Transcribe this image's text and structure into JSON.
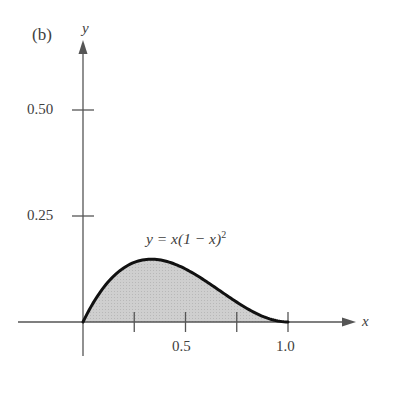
{
  "panel_label": "(b)",
  "chart_data": {
    "type": "area",
    "title": "",
    "function": "y = x(1 - x)^2",
    "equation_label": {
      "lhs": "y = x",
      "rest": "(1 − x)",
      "exponent": "2"
    },
    "xlabel": "x",
    "ylabel": "y",
    "x_ticks": [
      0.25,
      0.5,
      0.75,
      1.0
    ],
    "x_tick_labels": [
      "",
      "0.5",
      "",
      "1.0"
    ],
    "y_ticks": [
      0.25,
      0.5
    ],
    "y_tick_labels": [
      "0.25",
      "0.50"
    ],
    "xlim": [
      0,
      1.3
    ],
    "ylim": [
      0,
      0.66
    ],
    "grid": false,
    "shaded_region": {
      "from": 0,
      "to": 1.0,
      "fill": "#c8c8c8"
    },
    "x": [
      0,
      0.1,
      0.2,
      0.3,
      0.333,
      0.4,
      0.5,
      0.6,
      0.7,
      0.8,
      0.9,
      1.0
    ],
    "values": [
      0,
      0.081,
      0.128,
      0.147,
      0.148,
      0.144,
      0.125,
      0.096,
      0.063,
      0.032,
      0.009,
      0
    ]
  },
  "colors": {
    "curve": "#111111",
    "axis": "#555555",
    "fill": "#c8c8c8"
  }
}
